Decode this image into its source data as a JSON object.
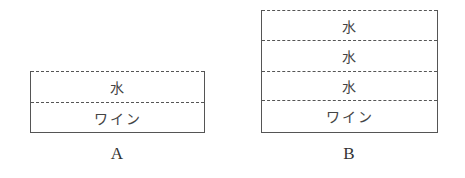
{
  "diagram": {
    "vessels": [
      {
        "label": "A",
        "layers_top_to_bottom": [
          "水",
          "ワイン"
        ]
      },
      {
        "label": "B",
        "layers_top_to_bottom": [
          "水",
          "水",
          "水",
          "ワイン"
        ]
      }
    ],
    "colors": {
      "line": "#555555",
      "text": "#444444",
      "background": "#ffffff"
    }
  }
}
